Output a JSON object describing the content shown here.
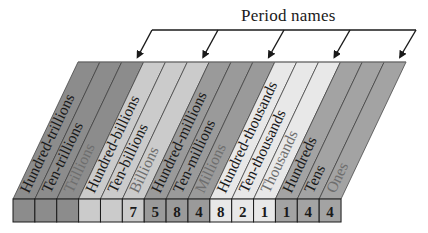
{
  "title": "Period names",
  "geometry": {
    "row_left": 13,
    "row_top": 199,
    "row_bottom": 222,
    "cell_width": 21.87,
    "top_y": 62,
    "top_left_x": 78,
    "bracket_y": 30,
    "bracket_left": 152,
    "bracket_right": 416
  },
  "periods": [
    {
      "name": "Trillions",
      "color": "#8c8c8c"
    },
    {
      "name": "Billions",
      "color": "#cbcbcb"
    },
    {
      "name": "Millions",
      "color": "#9a9a9a"
    },
    {
      "name": "Thousands",
      "color": "#e8e8e8"
    },
    {
      "name": "Ones",
      "color": "#a3a3a3"
    }
  ],
  "places": [
    {
      "label": "Hundred-trillions",
      "digit": "",
      "period": 0,
      "muted": false
    },
    {
      "label": "Ten-trillions",
      "digit": "",
      "period": 0,
      "muted": false
    },
    {
      "label": "Trillions",
      "digit": "",
      "period": 0,
      "muted": true
    },
    {
      "label": "Hundred-billions",
      "digit": "",
      "period": 1,
      "muted": false
    },
    {
      "label": "Ten-billions",
      "digit": "",
      "period": 1,
      "muted": false
    },
    {
      "label": "Billions",
      "digit": "7",
      "period": 1,
      "muted": true
    },
    {
      "label": "Hundred-millions",
      "digit": "5",
      "period": 2,
      "muted": false
    },
    {
      "label": "Ten-millions",
      "digit": "8",
      "period": 2,
      "muted": false
    },
    {
      "label": "Millions",
      "digit": "4",
      "period": 2,
      "muted": true
    },
    {
      "label": "Hundred-thousands",
      "digit": "8",
      "period": 3,
      "muted": false
    },
    {
      "label": "Ten-thousands",
      "digit": "2",
      "period": 3,
      "muted": false
    },
    {
      "label": "Thousands",
      "digit": "1",
      "period": 3,
      "muted": true
    },
    {
      "label": "Hundreds",
      "digit": "1",
      "period": 4,
      "muted": false
    },
    {
      "label": "Tens",
      "digit": "4",
      "period": 4,
      "muted": false
    },
    {
      "label": "Ones",
      "digit": "4",
      "period": 4,
      "muted": true
    }
  ],
  "number_shown": "7,584,821,144",
  "colors": {
    "text_dark": "#1a1a1a",
    "text_muted": "#6e6e6e",
    "divider": "#3a3a3a",
    "cell_border": "#1a1a1a"
  }
}
